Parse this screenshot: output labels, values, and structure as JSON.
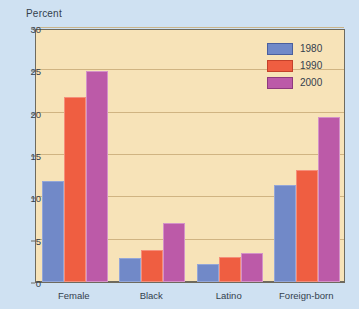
{
  "chart_data": {
    "type": "bar",
    "title": "",
    "xlabel": "",
    "ylabel": "Percent",
    "ylim": [
      0,
      30
    ],
    "yticks": [
      0,
      5,
      10,
      15,
      20,
      25,
      30
    ],
    "grid": true,
    "legend_position": "top-right",
    "categories": [
      "Female",
      "Black",
      "Latino",
      "Foreign-born"
    ],
    "series": [
      {
        "name": "1980",
        "color": "#7189c8",
        "values": [
          11.9,
          2.8,
          2.1,
          11.4
        ]
      },
      {
        "name": "1990",
        "color": "#ef5e41",
        "values": [
          21.9,
          3.8,
          2.9,
          13.2
        ]
      },
      {
        "name": "2000",
        "color": "#bc5aa8",
        "values": [
          24.9,
          7.0,
          3.4,
          19.5
        ]
      }
    ]
  },
  "colors": {
    "page_background": "#cfe1f2",
    "plot_background": "#f7e3b8",
    "axis": "#6e6a5e",
    "gridline": "#c9ab78",
    "text": "#33404d"
  }
}
